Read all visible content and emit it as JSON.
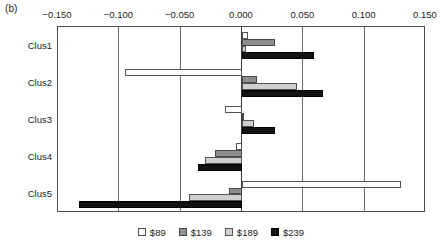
{
  "panel": {
    "label": "(b)"
  },
  "chart_data": {
    "type": "bar",
    "orientation": "horizontal",
    "title": "",
    "xlabel": "",
    "ylabel": "",
    "grid": true,
    "legend_position": "bottom",
    "xlim": [
      -0.15,
      0.15
    ],
    "xticks": [
      "-0.150",
      "-0.100",
      "-0.050",
      "0.000",
      "0.050",
      "0.100",
      "0.150"
    ],
    "xtick_values": [
      -0.15,
      -0.1,
      -0.05,
      0.0,
      0.05,
      0.1,
      0.15
    ],
    "categories": [
      "Clus1",
      "Clus2",
      "Clus3",
      "Clus4",
      "Clus5"
    ],
    "series": [
      {
        "name": "$89",
        "color": "#ffffff",
        "values": [
          0.005,
          -0.095,
          -0.014,
          -0.005,
          0.13
        ]
      },
      {
        "name": "$139",
        "color": "#8e8e8e",
        "values": [
          0.027,
          0.012,
          0.001,
          -0.022,
          -0.011
        ]
      },
      {
        "name": "$189",
        "color": "#cfcfcf",
        "values": [
          0.003,
          0.045,
          0.01,
          -0.03,
          -0.043
        ]
      },
      {
        "name": "$239",
        "color": "#131313",
        "values": [
          0.059,
          0.066,
          0.027,
          -0.036,
          -0.133
        ]
      }
    ]
  },
  "legend": {
    "items": [
      {
        "label": "$89",
        "swatch_class": "sw-89"
      },
      {
        "label": "$139",
        "swatch_class": "sw-139"
      },
      {
        "label": "$189",
        "swatch_class": "sw-189"
      },
      {
        "label": "$239",
        "swatch_class": "sw-239"
      }
    ]
  }
}
